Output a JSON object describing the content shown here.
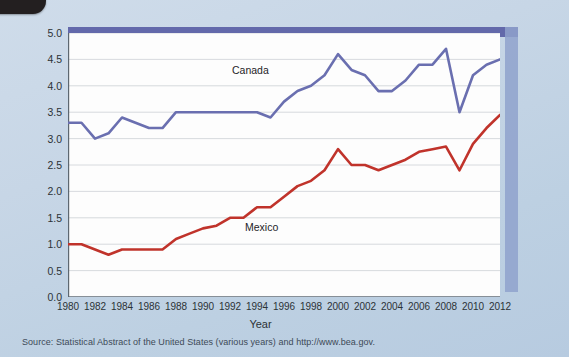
{
  "figure": {
    "background_color": "#c4d4e5",
    "plot_background": "#fdfdfd",
    "band_color": "#5a5fa5",
    "source_note": "Source: Statistical Abstract of the United States (various years) and http://www.bea.gov."
  },
  "chart_data": {
    "type": "line",
    "title": "",
    "xlabel": "Year",
    "ylabel": "Exports and imports as share of GDP",
    "xlim": [
      1980,
      2012
    ],
    "ylim": [
      0.0,
      5.0
    ],
    "grid": true,
    "legend": "inline-labels",
    "ytick_labels": [
      "0.0",
      "0.5",
      "1.0",
      "1.5",
      "2.0",
      "2.5",
      "3.0",
      "3.5",
      "4.0",
      "4.5",
      "5.0"
    ],
    "ytick_values": [
      0.0,
      0.5,
      1.0,
      1.5,
      2.0,
      2.5,
      3.0,
      3.5,
      4.0,
      4.5,
      5.0
    ],
    "xtick_labels": [
      "1980",
      "1982",
      "1984",
      "1986",
      "1988",
      "1990",
      "1992",
      "1994",
      "1996",
      "1998",
      "2000",
      "2002",
      "2004",
      "2006",
      "2008",
      "2010",
      "2012"
    ],
    "xtick_values": [
      1980,
      1982,
      1984,
      1986,
      1988,
      1990,
      1992,
      1994,
      1996,
      1998,
      2000,
      2002,
      2004,
      2006,
      2008,
      2010,
      2012
    ],
    "x": [
      1980,
      1981,
      1982,
      1983,
      1984,
      1985,
      1986,
      1987,
      1988,
      1989,
      1990,
      1991,
      1992,
      1993,
      1994,
      1995,
      1996,
      1997,
      1998,
      1999,
      2000,
      2001,
      2002,
      2003,
      2004,
      2005,
      2006,
      2007,
      2008,
      2009,
      2010,
      2011,
      2012
    ],
    "series": [
      {
        "name": "Canada",
        "color": "#6a6fb0",
        "label_x": 1993,
        "label_y": 4.2,
        "values": [
          3.3,
          3.3,
          3.0,
          3.1,
          3.4,
          3.3,
          3.2,
          3.2,
          3.5,
          3.5,
          3.5,
          3.5,
          3.5,
          3.5,
          3.5,
          3.4,
          3.7,
          3.9,
          4.0,
          4.2,
          4.6,
          4.3,
          4.2,
          3.9,
          3.9,
          4.1,
          4.4,
          4.4,
          4.7,
          3.5,
          4.2,
          4.4,
          4.5
        ]
      },
      {
        "name": "Mexico",
        "color": "#c0332b",
        "label_x": 1994,
        "label_y": 1.35,
        "values": [
          1.0,
          1.0,
          0.9,
          0.8,
          0.9,
          0.9,
          0.9,
          0.9,
          1.1,
          1.2,
          1.3,
          1.35,
          1.5,
          1.5,
          1.7,
          1.7,
          1.9,
          2.1,
          2.2,
          2.4,
          2.8,
          2.5,
          2.5,
          2.4,
          2.5,
          2.6,
          2.75,
          2.8,
          2.85,
          2.4,
          2.9,
          3.2,
          3.45
        ]
      }
    ]
  },
  "labels": {
    "canada": "Canada",
    "mexico": "Mexico",
    "x_axis_title": "Year",
    "y_axis_title": "Exports and imports as share of GDP"
  }
}
